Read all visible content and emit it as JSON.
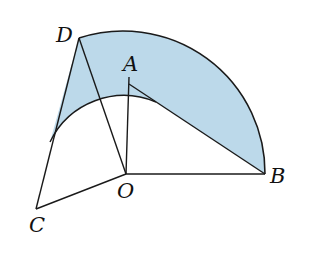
{
  "diagram": {
    "type": "geometry-figure",
    "fill_color": "#bcd9ea",
    "stroke_color": "#1a1a1a",
    "points": {
      "O": {
        "label": "O",
        "x": 126,
        "y": 174
      },
      "A": {
        "label": "A",
        "x": 129,
        "y": 77
      },
      "B": {
        "label": "B",
        "x": 265,
        "y": 174
      },
      "C": {
        "label": "C",
        "x": 36,
        "y": 213
      },
      "D": {
        "label": "D",
        "x": 79,
        "y": 38
      }
    },
    "segments": [
      "OA",
      "AB",
      "OB",
      "OD",
      "OC",
      "CD"
    ],
    "arcs": [
      {
        "name": "outer-arc",
        "center": "O",
        "from": "D",
        "to": "B"
      },
      {
        "name": "inner-arc",
        "center": "O",
        "from": "CD",
        "to": "AB",
        "tangent_to": "AB"
      }
    ],
    "shaded_region": "region between outer arc DB and inner arc, bounded by CD and AB"
  }
}
